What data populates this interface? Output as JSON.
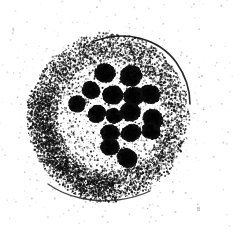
{
  "figure": {
    "caption": "",
    "width": 233,
    "height": 232,
    "background_color": "#ffffff",
    "ink_color": "#101010",
    "render_style": "stipple-halftone"
  },
  "corner_mark": {
    "text": "B",
    "x": 197,
    "y": 207,
    "color": "#9a9a9a"
  },
  "cell": {
    "label": "cell-body",
    "center_x": 110,
    "center_y": 116,
    "radius_x": 80,
    "radius_y": 84,
    "rotation_deg": -8,
    "cytoplasm_ring": {
      "label": "granular-cytoplasm-ring",
      "inner_radius_x": 52,
      "inner_radius_y": 55,
      "outer_radius_x": 80,
      "outer_radius_y": 84,
      "density": 0.52,
      "dot_color": "#151515"
    },
    "interior": {
      "label": "clear-nucleoplasm",
      "radius_x": 52,
      "radius_y": 55,
      "density": 0.06
    },
    "halo": {
      "label": "outer-scatter-halo",
      "radius_x": 100,
      "radius_y": 102,
      "density": 0.012
    }
  },
  "membrane_arcs": [
    {
      "name": "upper-right-membrane-arc",
      "path": "M 95 41 C 125 30 158 38 176 62 C 186 76 190 92 190 104",
      "stroke": "#131313",
      "width": 1.6,
      "opacity": 0.92
    },
    {
      "name": "lower-left-membrane-arc",
      "path": "M 48 184 C 66 197 92 203 118 200 C 132 198 142 195 150 191",
      "stroke": "#1a1a1a",
      "width": 1.3,
      "opacity": 0.8
    },
    {
      "name": "upper-right-inner-arc",
      "path": "M 120 44 C 148 44 170 60 180 80",
      "stroke": "#242424",
      "width": 0.8,
      "opacity": 0.55
    }
  ],
  "chromosomes": [
    {
      "id": 1,
      "label": "chromosome-1",
      "cx": 105,
      "cy": 73,
      "rx": 10,
      "ry": 9,
      "rot": 18,
      "lobes": 4
    },
    {
      "id": 2,
      "label": "chromosome-2",
      "cx": 131,
      "cy": 76,
      "rx": 11,
      "ry": 10,
      "rot": -25,
      "lobes": 4
    },
    {
      "id": 3,
      "label": "chromosome-3",
      "cx": 91,
      "cy": 90,
      "rx": 9,
      "ry": 8,
      "rot": 40,
      "lobes": 3
    },
    {
      "id": 4,
      "label": "chromosome-4",
      "cx": 113,
      "cy": 95,
      "rx": 10,
      "ry": 9,
      "rot": 5,
      "lobes": 4
    },
    {
      "id": 5,
      "label": "chromosome-5",
      "cx": 134,
      "cy": 96,
      "rx": 10,
      "ry": 9,
      "rot": -12,
      "lobes": 4
    },
    {
      "id": 6,
      "label": "chromosome-6",
      "cx": 150,
      "cy": 94,
      "rx": 10,
      "ry": 9,
      "rot": 30,
      "lobes": 4
    },
    {
      "id": 7,
      "label": "chromosome-7",
      "cx": 77,
      "cy": 104,
      "rx": 8,
      "ry": 8,
      "rot": 15,
      "lobes": 3
    },
    {
      "id": 8,
      "label": "chromosome-8",
      "cx": 97,
      "cy": 114,
      "rx": 9,
      "ry": 8,
      "rot": -35,
      "lobes": 3
    },
    {
      "id": 9,
      "label": "chromosome-9",
      "cx": 114,
      "cy": 116,
      "rx": 8,
      "ry": 7,
      "rot": 22,
      "lobes": 3
    },
    {
      "id": 10,
      "label": "chromosome-10",
      "cx": 130,
      "cy": 112,
      "rx": 10,
      "ry": 9,
      "rot": -8,
      "lobes": 4
    },
    {
      "id": 11,
      "label": "chromosome-11",
      "cx": 153,
      "cy": 119,
      "rx": 10,
      "ry": 9,
      "rot": 45,
      "lobes": 4
    },
    {
      "id": 12,
      "label": "chromosome-12",
      "cx": 110,
      "cy": 133,
      "rx": 9,
      "ry": 8,
      "rot": 10,
      "lobes": 3
    },
    {
      "id": 13,
      "label": "chromosome-13",
      "cx": 131,
      "cy": 133,
      "rx": 10,
      "ry": 8,
      "rot": -20,
      "lobes": 4
    },
    {
      "id": 14,
      "label": "chromosome-14",
      "cx": 151,
      "cy": 131,
      "rx": 9,
      "ry": 8,
      "rot": 28,
      "lobes": 3
    },
    {
      "id": 15,
      "label": "chromosome-15",
      "cx": 110,
      "cy": 147,
      "rx": 9,
      "ry": 8,
      "rot": -5,
      "lobes": 3
    },
    {
      "id": 16,
      "label": "chromosome-16",
      "cx": 127,
      "cy": 158,
      "rx": 10,
      "ry": 9,
      "rot": 35,
      "lobes": 4
    }
  ],
  "speckle_field": {
    "label": "background-speckles",
    "count": 260,
    "color": "#b4b4b4",
    "min_size": 0.4,
    "max_size": 1.1
  },
  "accessibility": {
    "alt_text": "Black and white stippled micrograph showing a roughly circular cell with a dense granular cytoplasmic ring and about sixteen dark condensed chromosomes clustered in the central clear area."
  }
}
